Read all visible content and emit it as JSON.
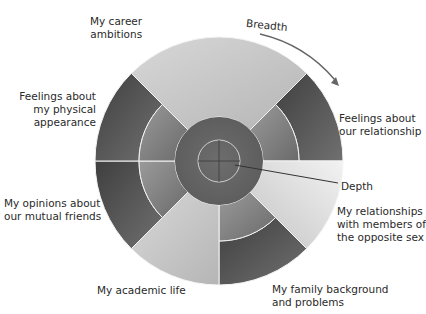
{
  "diagram": {
    "center": [
      219,
      161
    ],
    "radii": {
      "outer": 124,
      "middle": 80,
      "inner": 44,
      "core": 21
    },
    "axes_labels": {
      "breadth": "Breadth",
      "depth": "Depth"
    },
    "sectors": [
      {
        "id": "career",
        "label": "My career\nambitions",
        "start_deg": -135,
        "end_deg": -45,
        "depth": "inner",
        "color_outer": "#c9c9c9",
        "color_mid": "#b8b8b8"
      },
      {
        "id": "relationship",
        "label": "Feelings about\nour relationship",
        "start_deg": -45,
        "end_deg": 0,
        "depth": "middle",
        "color_outer": "#5a5a5a",
        "color_mid": "#7a7a7a"
      },
      {
        "id": "opposite-sex",
        "label": "My relationships\nwith members of\nthe opposite sex",
        "start_deg": 0,
        "end_deg": 45,
        "depth": "inner",
        "color_outer": "#e4e4e4",
        "color_mid": "#cfcfcf"
      },
      {
        "id": "family",
        "label": "My family background\nand problems",
        "start_deg": 45,
        "end_deg": 90,
        "depth": "middle",
        "color_outer": "#4e4e4e",
        "color_mid": "#8a8a8a"
      },
      {
        "id": "academic",
        "label": "My academic life",
        "start_deg": 90,
        "end_deg": 135,
        "depth": "inner",
        "color_outer": "#cbcbcb",
        "color_mid": "#bdbdbd"
      },
      {
        "id": "mutual-friends",
        "label": "My opinions about\nour mutual friends",
        "start_deg": 135,
        "end_deg": 180,
        "depth": "middle",
        "color_outer": "#5c5c5c",
        "color_mid": "#6e6e6e"
      },
      {
        "id": "physical",
        "label": "Feelings about\nmy physical\nappearance",
        "start_deg": 180,
        "end_deg": 225,
        "depth": "middle",
        "color_outer": "#555555",
        "color_mid": "#8e8e8e"
      }
    ],
    "core_color": "#6a6a6a",
    "inner_color": "#777777"
  }
}
